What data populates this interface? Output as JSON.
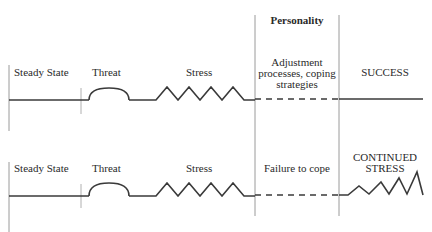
{
  "diagram": {
    "header": {
      "label": "Personality"
    },
    "colors": {
      "line": "#3a3a3a",
      "divider": "#9a9a9a"
    },
    "rows": [
      {
        "id": "top",
        "stages": [
          "Steady State",
          "Threat",
          "Stress"
        ],
        "personality_text": [
          "Adjustment",
          "processes, coping",
          "strategies"
        ],
        "outcome": [
          "SUCCESS"
        ],
        "outcome_shape": "flat"
      },
      {
        "id": "bottom",
        "stages": [
          "Steady State",
          "Threat",
          "Stress"
        ],
        "personality_text": [
          "Failure to cope"
        ],
        "outcome": [
          "CONTINUED",
          "STRESS"
        ],
        "outcome_shape": "rising-zigzag"
      }
    ]
  }
}
